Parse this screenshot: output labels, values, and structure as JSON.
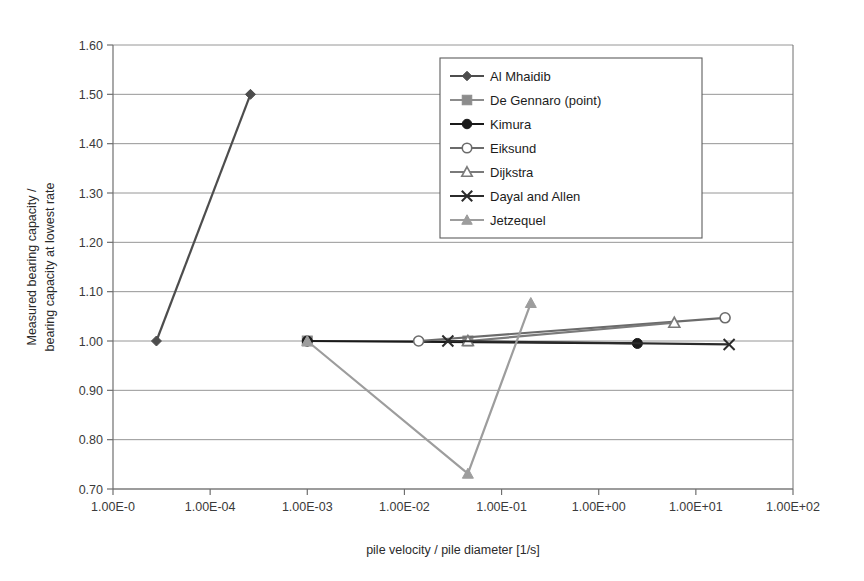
{
  "chart_data": {
    "type": "line",
    "title": "",
    "xlabel": "pile velocity / pile diameter [1/s]",
    "ylabel_line1": "Measured bearing capacity /",
    "ylabel_line2": "bearing capacity at lowest rate",
    "x_scale": "log",
    "xlim": [
      1e-05,
      100.0
    ],
    "ylim": [
      0.7,
      1.6
    ],
    "grid": "horizontal",
    "legend_position": "top-right",
    "x_tick_labels": [
      "1.00E-0",
      "1.00E-04",
      "1.00E-03",
      "1.00E-02",
      "1.00E-01",
      "1.00E+00",
      "1.00E+01",
      "1.00E+02"
    ],
    "x_tick_values": [
      1e-05,
      0.0001,
      0.001,
      0.01,
      0.1,
      1,
      10,
      100
    ],
    "y_tick_labels": [
      "0.70",
      "0.80",
      "0.90",
      "1.00",
      "1.10",
      "1.20",
      "1.30",
      "1.40",
      "1.50",
      "1.60"
    ],
    "y_tick_values": [
      0.7,
      0.8,
      0.9,
      1.0,
      1.1,
      1.2,
      1.3,
      1.4,
      1.5,
      1.6
    ],
    "series": [
      {
        "name": "Al Mhaidib",
        "marker": "diamond",
        "color": "#4d4d4d",
        "x": [
          2.8e-05,
          0.00026
        ],
        "y": [
          1.0,
          1.5
        ]
      },
      {
        "name": "De Gennaro (point)",
        "marker": "square",
        "color": "#8c8c8c",
        "x": [
          0.001,
          0.045
        ],
        "y": [
          1.0,
          1.0
        ]
      },
      {
        "name": "Kimura",
        "marker": "circle-filled",
        "color": "#1a1a1a",
        "x": [
          0.001,
          2.5
        ],
        "y": [
          1.0,
          0.995
        ]
      },
      {
        "name": "Eiksund",
        "marker": "circle-open",
        "color": "#6b6b6b",
        "x": [
          0.014,
          20.0
        ],
        "y": [
          1.0,
          1.047
        ]
      },
      {
        "name": "Dijkstra",
        "marker": "triangle-open",
        "color": "#7a7a7a",
        "x": [
          0.045,
          6.0
        ],
        "y": [
          1.0,
          1.037
        ]
      },
      {
        "name": "Dayal and Allen",
        "marker": "x-cross",
        "color": "#2b2b2b",
        "x": [
          0.028,
          22.0
        ],
        "y": [
          1.0,
          0.993
        ]
      },
      {
        "name": "Jetzequel",
        "marker": "triangle-filled",
        "color": "#9d9d9d",
        "x": [
          0.001,
          0.045,
          0.2
        ],
        "y": [
          1.0,
          0.731,
          1.077
        ]
      }
    ],
    "legend_entries": [
      {
        "label": "Al Mhaidib",
        "marker": "diamond",
        "color": "#4d4d4d"
      },
      {
        "label": "De Gennaro (point)",
        "marker": "square",
        "color": "#8c8c8c"
      },
      {
        "label": "Kimura",
        "marker": "circle-filled",
        "color": "#1a1a1a"
      },
      {
        "label": "Eiksund",
        "marker": "circle-open",
        "color": "#6b6b6b"
      },
      {
        "label": "Dijkstra",
        "marker": "triangle-open",
        "color": "#7a7a7a"
      },
      {
        "label": "Dayal and Allen",
        "marker": "x-cross",
        "color": "#2b2b2b"
      },
      {
        "label": "Jetzequel",
        "marker": "triangle-filled",
        "color": "#9d9d9d"
      }
    ],
    "colors": {
      "axis": "#6f6f6f",
      "grid": "#8a8a8a",
      "text": "#231f20",
      "background": "#ffffff"
    }
  }
}
